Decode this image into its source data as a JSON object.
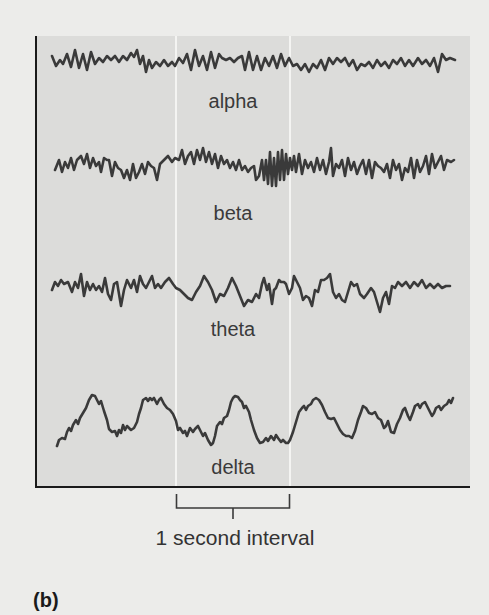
{
  "figure": {
    "panel_tag": "(b)",
    "bracket_label": "1 second interval",
    "colors": {
      "page_background": "#ececea",
      "panel_background": "#dcdcda",
      "trace": "#3a3a3a",
      "interval_marker": "#f4f4f2",
      "axis": "#1a1a1a"
    },
    "waves": [
      {
        "name": "alpha",
        "label": "alpha"
      },
      {
        "name": "beta",
        "label": "beta"
      },
      {
        "name": "theta",
        "label": "theta"
      },
      {
        "name": "delta",
        "label": "delta"
      }
    ]
  }
}
